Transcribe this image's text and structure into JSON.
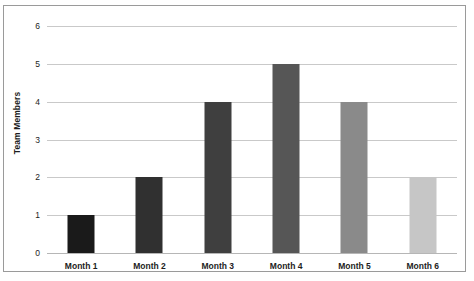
{
  "chart_data": {
    "type": "bar",
    "title": "",
    "xlabel": "",
    "ylabel": "Team Members",
    "categories": [
      "Month 1",
      "Month 2",
      "Month 3",
      "Month 4",
      "Month 5",
      "Month 6"
    ],
    "values": [
      1,
      2,
      4,
      5,
      4,
      2
    ],
    "ylim": [
      0,
      6
    ],
    "yticks": [
      "0",
      "1",
      "2",
      "3",
      "4",
      "5",
      "6"
    ],
    "ytick_values": [
      0,
      1,
      2,
      3,
      4,
      5,
      6
    ],
    "grid": true,
    "legend": "none",
    "bar_colors": [
      "#1a1a1a",
      "#303030",
      "#3f3f3f",
      "#565656",
      "#8a8a8a",
      "#c6c6c6"
    ],
    "gridline_color": "#c9c9c9",
    "axis_color": "#b6b6b6",
    "frame_color": "#9a9a9a",
    "text_color": "#1d1d1d"
  }
}
